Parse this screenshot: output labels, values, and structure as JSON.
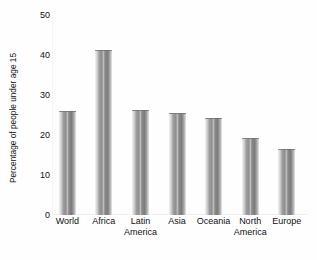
{
  "chart_data": {
    "type": "bar",
    "title": "",
    "xlabel": "",
    "ylabel": "Percentage of people under age 15",
    "ylim": [
      0,
      50
    ],
    "yticks": [
      0,
      10,
      20,
      30,
      40,
      50
    ],
    "grid": false,
    "legend": false,
    "categories": [
      "World",
      "Africa",
      "Latin America",
      "Asia",
      "Oceania",
      "North America",
      "Europe"
    ],
    "category_lines": [
      [
        "World",
        ""
      ],
      [
        "Africa",
        ""
      ],
      [
        "Latin",
        "America"
      ],
      [
        "Asia",
        ""
      ],
      [
        "Oceania",
        ""
      ],
      [
        "North",
        "America"
      ],
      [
        "Europe",
        ""
      ]
    ],
    "values": [
      26,
      41.3,
      26.2,
      25.5,
      24.3,
      19.3,
      16.5
    ],
    "bar_color": "#8e8e8e",
    "background_color": "#ffffff",
    "axis_color": "#3a3a3a"
  },
  "yticks_labels": [
    "50",
    "40",
    "30",
    "20",
    "10",
    "0"
  ]
}
